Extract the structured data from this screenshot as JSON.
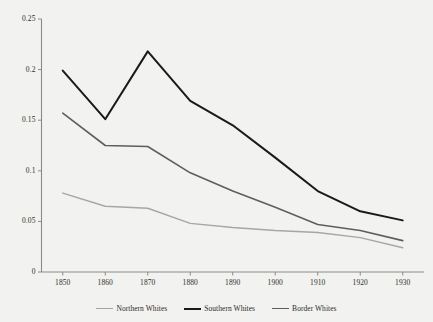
{
  "chart_data": {
    "type": "line",
    "title": "",
    "subtitle": "",
    "xlabel": "",
    "ylabel": "",
    "x": [
      1850,
      1860,
      1870,
      1880,
      1890,
      1900,
      1910,
      1920,
      1930
    ],
    "categories": [
      "1850",
      "1860",
      "1870",
      "1880",
      "1890",
      "1900",
      "1910",
      "1920",
      "1930"
    ],
    "xlim": [
      1845,
      1935
    ],
    "ylim": [
      0,
      0.25
    ],
    "yticks": [
      0,
      0.05,
      0.1,
      0.15,
      0.2,
      0.25
    ],
    "ytick_labels": [
      "0",
      "0.05",
      "0.1",
      "0.15",
      "0.2",
      "0.25"
    ],
    "xticks": [
      1850,
      1860,
      1870,
      1880,
      1890,
      1900,
      1910,
      1920,
      1930
    ],
    "xtick_labels": [
      "1850",
      "1860",
      "1870",
      "1880",
      "1890",
      "1900",
      "1910",
      "1920",
      "1930"
    ],
    "grid": false,
    "legend_position": "bottom",
    "series": [
      {
        "name": "Northern Whites",
        "color": "#a6a6a6",
        "width": 1.4,
        "values": [
          0.078,
          0.065,
          0.063,
          0.048,
          0.044,
          0.041,
          0.039,
          0.034,
          0.024
        ]
      },
      {
        "name": "Southern Whites",
        "color": "#1a1a1a",
        "width": 2.0,
        "values": [
          0.199,
          0.151,
          0.218,
          0.169,
          0.145,
          0.113,
          0.08,
          0.06,
          0.051
        ]
      },
      {
        "name": "Border Whites",
        "color": "#5e5e5e",
        "width": 1.6,
        "values": [
          0.157,
          0.125,
          0.124,
          0.098,
          0.08,
          0.064,
          0.047,
          0.041,
          0.031
        ]
      }
    ]
  },
  "axes": {
    "axis_color": "#8a8a8a",
    "tick_color": "#8a8a8a"
  },
  "legend": {
    "items": [
      {
        "label": "Northern Whites",
        "color": "#a6a6a6",
        "width": 1.6
      },
      {
        "label": "Southern Whites",
        "color": "#1a1a1a",
        "width": 2.2
      },
      {
        "label": "Border Whites",
        "color": "#5e5e5e",
        "width": 1.8
      }
    ]
  },
  "background": "#f2f2f0"
}
